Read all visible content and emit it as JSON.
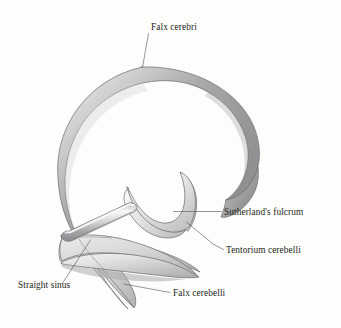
{
  "figure": {
    "background_color": "#fdfdfc",
    "line_color": "#58585a",
    "outline_color": "#6f7073",
    "text_color": "#231f20"
  },
  "labels": [
    {
      "id": "falx-cerebri",
      "text": "Falx cerebri",
      "x": 151,
      "y": 30,
      "anchor": "start",
      "leader": "M148.5,33.5 L142.5,67.5"
    },
    {
      "id": "sutherlands-fulcrum",
      "text": "Sutherland's fulcrum",
      "x": 224,
      "y": 215,
      "anchor": "start",
      "leader": "M221.5,211.5 L173.5,211.5"
    },
    {
      "id": "tentorium-cerebelli",
      "text": "Tentorium cerebelli",
      "x": 226,
      "y": 253,
      "anchor": "start",
      "leader": "M223.5,249.5 L213.0,244.0 L186.5,222.0"
    },
    {
      "id": "straight-sinus",
      "text": "Straight sinus",
      "x": 18,
      "y": 288,
      "anchor": "start",
      "leader": "M62.0,284.0 L90.5,240.0"
    },
    {
      "id": "falx-cerebelli",
      "text": "Falx cerebelli",
      "x": 173,
      "y": 296,
      "anchor": "start",
      "leader": "M170.0,292.5 L124.0,284.0"
    }
  ],
  "structures": [
    {
      "id": "falx-cerebri-band",
      "name": "Falx cerebri",
      "description": "Large sickle-shaped C band forming the vertical midline membrane",
      "fill_light": "#d8d9da",
      "fill_mid": "#9b9c9e",
      "fill_dark": "#8a8b8d"
    },
    {
      "id": "tentorium-cerebelli-sheet",
      "name": "Tentorium cerebelli",
      "description": "Horizontal tent-like sheet spanning beneath the falx cerebri",
      "fill_light": "#eceded",
      "fill_mid": "#c9cacb",
      "fill_dark": "#a9aaac"
    },
    {
      "id": "sutherlands-fulcrum-crescent",
      "name": "Sutherland's fulcrum",
      "description": "Crescent saddle where the falx and tentorium converge",
      "fill_light": "#f0f1f1",
      "fill_mid": "#cfd0d1"
    },
    {
      "id": "falx-cerebelli-tail",
      "name": "Falx cerebelli",
      "description": "Small pointed tail descending below the tentorium",
      "fill_light": "#e9eaea",
      "fill_mid": "#bfc0c2"
    },
    {
      "id": "straight-sinus-tube",
      "name": "Straight sinus",
      "description": "Tubular ridge at the junction of falx cerebri and tentorium",
      "fill_light": "#f4f4f4",
      "fill_mid": "#a8a9ab"
    }
  ]
}
